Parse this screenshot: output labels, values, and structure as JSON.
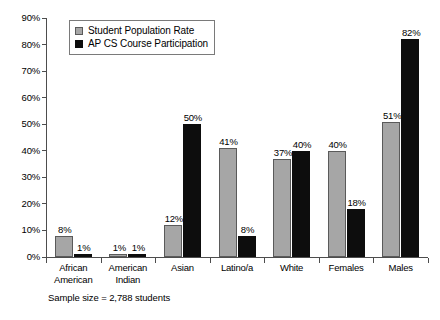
{
  "chart_data": {
    "type": "bar",
    "title": "",
    "subtitle": "",
    "xlabel": "",
    "ylabel": "",
    "ylim": [
      0,
      90
    ],
    "ytick_labels": [
      "0%",
      "10%",
      "20%",
      "30%",
      "40%",
      "50%",
      "60%",
      "70%",
      "80%",
      "90%"
    ],
    "ytick_values": [
      0,
      10,
      20,
      30,
      40,
      50,
      60,
      70,
      80,
      90
    ],
    "grid": false,
    "legend_position": "top-left",
    "categories": [
      "African American",
      "American Indian",
      "Asian",
      "Latino/a",
      "White",
      "Females",
      "Males"
    ],
    "category_lines": [
      [
        "African",
        "American"
      ],
      [
        "American",
        "Indian"
      ],
      [
        "Asian"
      ],
      [
        "Latino/a"
      ],
      [
        "White"
      ],
      [
        "Females"
      ],
      [
        "Males"
      ]
    ],
    "series": [
      {
        "name": "Student Population Rate",
        "color": "#a6a6a6",
        "values": [
          8,
          1,
          12,
          41,
          37,
          40,
          51
        ],
        "labels": [
          "8%",
          "1%",
          "12%",
          "41%",
          "37%",
          "40%",
          "51%"
        ]
      },
      {
        "name": "AP CS Course Participation",
        "color": "#0d0d0d",
        "values": [
          1,
          1,
          50,
          8,
          40,
          18,
          82
        ],
        "labels": [
          "1%",
          "1%",
          "50%",
          "8%",
          "40%",
          "18%",
          "82%"
        ]
      }
    ],
    "annotation": "Sample size = 2,788 students"
  },
  "legend": {
    "items": [
      {
        "label": "Student Population Rate"
      },
      {
        "label": "AP CS Course Participation"
      }
    ]
  },
  "footnote": {
    "text": "Sample size = 2,788 students"
  }
}
